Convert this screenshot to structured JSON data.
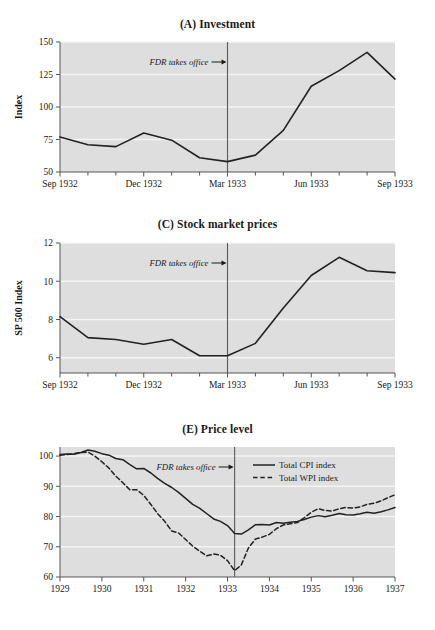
{
  "figure": {
    "background": "#ffffff",
    "plot_background": "#dedede",
    "gridline_color": "#f4f4f4",
    "line_color": "#222222",
    "axis_color": "#555555"
  },
  "panels": [
    {
      "id": "A",
      "title": "(A) Investment",
      "annotation": "FDR takes office",
      "ylabel": "Index"
    },
    {
      "id": "C",
      "title": "(C) Stock market prices",
      "annotation": "FDR takes office",
      "ylabel": "SP 500 Index"
    },
    {
      "id": "E",
      "title": "(E) Price level",
      "annotation": "FDR takes office",
      "ylabel": ""
    }
  ],
  "chart_data": [
    {
      "type": "line",
      "panel": "A",
      "title": "(A) Investment",
      "xlabel": "",
      "ylabel": "Index",
      "ylim": [
        50,
        150
      ],
      "yticks": [
        50,
        75,
        100,
        125,
        150
      ],
      "xlim": [
        0,
        12
      ],
      "xtick_positions": [
        0,
        3,
        6,
        9,
        12
      ],
      "xtick_labels": [
        "Sep 1932",
        "Dec 1932",
        "Mar 1933",
        "Jun 1933",
        "Sep 1933"
      ],
      "minor_xticks": [
        1,
        2,
        4,
        5,
        7,
        8,
        10,
        11
      ],
      "grid": true,
      "legend": null,
      "vline": {
        "x": 6,
        "label": "FDR takes office"
      },
      "x": [
        0,
        1,
        2,
        3,
        4,
        5,
        6,
        7,
        8,
        9,
        10,
        11,
        12
      ],
      "series": [
        {
          "name": "Investment index",
          "style": "solid",
          "values": [
            77,
            71,
            69.5,
            80,
            74.5,
            61,
            58,
            63,
            82,
            116,
            128,
            142,
            121.5
          ]
        }
      ]
    },
    {
      "type": "line",
      "panel": "C",
      "title": "(C) Stock market prices",
      "xlabel": "",
      "ylabel": "SP 500 Index",
      "ylim": [
        5.2,
        12
      ],
      "yticks": [
        6,
        8,
        10,
        12
      ],
      "xlim": [
        0,
        12
      ],
      "xtick_positions": [
        0,
        3,
        6,
        9,
        12
      ],
      "xtick_labels": [
        "Sep 1932",
        "Dec 1932",
        "Mar 1933",
        "Jun 1933",
        "Sep 1933"
      ],
      "minor_xticks": [
        1,
        2,
        4,
        5,
        7,
        8,
        10,
        11
      ],
      "grid": true,
      "legend": null,
      "vline": {
        "x": 6,
        "label": "FDR takes office"
      },
      "x": [
        0,
        1,
        2,
        3,
        4,
        5,
        6,
        7,
        8,
        9,
        10,
        11,
        12
      ],
      "series": [
        {
          "name": "SP 500 Index",
          "style": "solid",
          "values": [
            8.15,
            7.05,
            6.95,
            6.7,
            6.95,
            6.1,
            6.1,
            6.75,
            8.6,
            10.3,
            11.25,
            10.55,
            10.45
          ]
        }
      ]
    },
    {
      "type": "line",
      "panel": "E",
      "title": "(E) Price level",
      "xlabel": "",
      "ylabel": "",
      "ylim": [
        60,
        103
      ],
      "yticks": [
        60,
        70,
        80,
        90,
        100
      ],
      "xlim": [
        1929,
        1937
      ],
      "xtick_positions": [
        1929,
        1930,
        1931,
        1932,
        1933,
        1934,
        1935,
        1936,
        1937
      ],
      "xtick_labels": [
        "1929",
        "1930",
        "1931",
        "1932",
        "1933",
        "1934",
        "1935",
        "1936",
        "1937"
      ],
      "grid": true,
      "legend": {
        "position": "top-right",
        "entries": [
          "Total CPI index",
          "Total WPI index"
        ]
      },
      "vline": {
        "x": 1933.17,
        "label": "FDR takes office"
      },
      "x": [
        1929.0,
        1929.17,
        1929.33,
        1929.5,
        1929.67,
        1929.83,
        1930.0,
        1930.17,
        1930.33,
        1930.5,
        1930.67,
        1930.83,
        1931.0,
        1931.17,
        1931.33,
        1931.5,
        1931.67,
        1931.83,
        1932.0,
        1932.17,
        1932.33,
        1932.5,
        1932.67,
        1932.83,
        1933.0,
        1933.17,
        1933.33,
        1933.5,
        1933.67,
        1933.83,
        1934.0,
        1934.17,
        1934.33,
        1934.5,
        1934.67,
        1934.83,
        1935.0,
        1935.17,
        1935.33,
        1935.5,
        1935.67,
        1935.83,
        1936.0,
        1936.17,
        1936.33,
        1936.5,
        1936.67,
        1936.83,
        1937.0
      ],
      "series": [
        {
          "name": "Total CPI index",
          "style": "solid",
          "values": [
            100.5,
            100.7,
            100.6,
            101.2,
            102.0,
            101.6,
            100.8,
            100.3,
            99.2,
            98.8,
            97.2,
            95.8,
            95.9,
            94.4,
            92.6,
            91.0,
            89.6,
            88.0,
            86.0,
            84.0,
            82.8,
            81.0,
            79.2,
            78.4,
            77.0,
            74.4,
            74.2,
            75.6,
            77.3,
            77.4,
            77.2,
            78.0,
            77.8,
            78.1,
            78.4,
            79.0,
            79.8,
            80.3,
            79.9,
            80.4,
            81.0,
            80.6,
            80.5,
            80.9,
            81.4,
            81.1,
            81.6,
            82.2,
            83.0
          ]
        },
        {
          "name": "Total WPI index",
          "style": "dashed",
          "values": [
            100.3,
            100.5,
            100.8,
            101.2,
            101.3,
            100.0,
            98.1,
            96.0,
            93.4,
            91.2,
            88.8,
            88.9,
            87.0,
            84.0,
            81.0,
            78.4,
            75.2,
            74.6,
            72.4,
            70.2,
            68.6,
            67.0,
            67.6,
            67.2,
            65.4,
            62.1,
            64.0,
            69.6,
            72.6,
            73.2,
            74.1,
            76.0,
            77.2,
            77.6,
            78.0,
            79.6,
            81.4,
            82.6,
            82.0,
            81.8,
            82.6,
            83.0,
            82.8,
            83.2,
            84.0,
            84.4,
            85.2,
            86.2,
            87.2
          ]
        }
      ]
    }
  ]
}
